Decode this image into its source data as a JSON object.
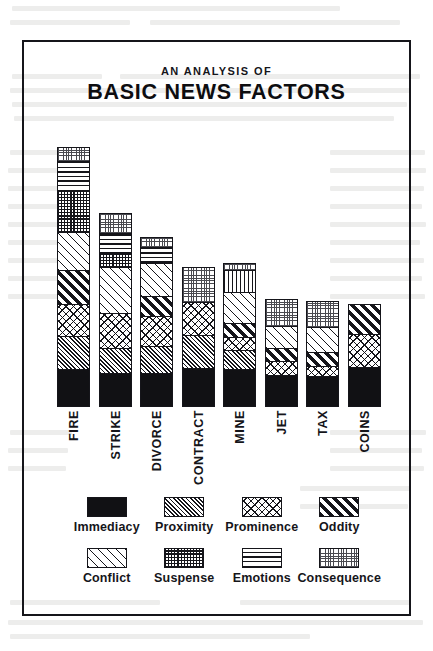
{
  "figure": {
    "title_sub": "AN ANALYSIS OF",
    "title_main": "BASIC NEWS FACTORS",
    "border_color": "#15151a",
    "ink_color": "#15151a",
    "paper_color": "#ffffff"
  },
  "chart_data": {
    "type": "bar",
    "subtype": "stacked-bar",
    "title": "AN ANALYSIS OF BASIC NEWS FACTORS",
    "subtitle": "AN ANALYSIS OF",
    "xlabel": "",
    "ylabel": "",
    "grid": false,
    "axis_ticks": false,
    "ylim": [
      0,
      260
    ],
    "legend_position": "bottom",
    "categories": [
      "FIRE",
      "STRIKE",
      "DIVORCE",
      "CONTRACT",
      "MINE",
      "JET",
      "TAX",
      "COINS"
    ],
    "totals": [
      260,
      194,
      170,
      140,
      144,
      108,
      106,
      103
    ],
    "series": [
      {
        "name": "Immediacy",
        "pattern": "solid-black",
        "values": [
          36,
          32,
          32,
          38,
          36,
          31,
          30,
          39
        ]
      },
      {
        "name": "Proximity",
        "pattern": "fine-diagonal",
        "values": [
          34,
          26,
          28,
          33,
          20,
          0,
          0,
          0
        ]
      },
      {
        "name": "Prominence",
        "pattern": "cross-hatch",
        "values": [
          32,
          35,
          30,
          33,
          13,
          14,
          10,
          33
        ]
      },
      {
        "name": "Oddity",
        "pattern": "bold-diagonal",
        "values": [
          34,
          0,
          20,
          0,
          14,
          13,
          14,
          31
        ]
      },
      {
        "name": "Conflict",
        "pattern": "sparse-diagonal",
        "values": [
          38,
          46,
          34,
          0,
          32,
          23,
          25,
          0
        ]
      },
      {
        "name": "Suspense",
        "pattern": "dark-grid",
        "values": [
          42,
          14,
          0,
          0,
          0,
          0,
          0,
          0
        ]
      },
      {
        "name": "Emotions",
        "pattern": "horizontal-lines",
        "values": [
          30,
          21,
          16,
          0,
          22,
          0,
          0,
          0
        ]
      },
      {
        "name": "Consequence",
        "pattern": "light-stipple",
        "values": [
          14,
          20,
          10,
          36,
          7,
          27,
          27,
          0
        ]
      }
    ],
    "stack_order_bottom_to_top": [
      "Immediacy",
      "Proximity",
      "Prominence",
      "Oddity",
      "Conflict",
      "Suspense",
      "Emotions",
      "Consequence"
    ],
    "bars": [
      {
        "category": "FIRE",
        "segments_top_to_bottom": [
          "Consequence",
          "Emotions",
          "Suspense",
          "Conflict",
          "Oddity",
          "Prominence",
          "Proximity",
          "Immediacy"
        ]
      },
      {
        "category": "STRIKE",
        "segments_top_to_bottom": [
          "Consequence",
          "Emotions",
          "Suspense",
          "Conflict",
          "Prominence",
          "Proximity",
          "Immediacy"
        ]
      },
      {
        "category": "DIVORCE",
        "segments_top_to_bottom": [
          "Consequence",
          "Emotions",
          "Conflict",
          "Oddity",
          "Prominence",
          "Proximity",
          "Immediacy"
        ]
      },
      {
        "category": "CONTRACT",
        "segments_top_to_bottom": [
          "Consequence",
          "Prominence",
          "Proximity",
          "Immediacy"
        ]
      },
      {
        "category": "MINE",
        "segments_top_to_bottom": [
          "Consequence",
          "Emotions",
          "Conflict",
          "Oddity",
          "Prominence",
          "Proximity",
          "Immediacy"
        ]
      },
      {
        "category": "JET",
        "segments_top_to_bottom": [
          "Consequence",
          "Conflict",
          "Oddity",
          "Prominence",
          "Immediacy"
        ]
      },
      {
        "category": "TAX",
        "segments_top_to_bottom": [
          "Consequence",
          "Conflict",
          "Oddity",
          "Prominence",
          "Immediacy"
        ]
      },
      {
        "category": "COINS",
        "segments_top_to_bottom": [
          "Oddity",
          "Prominence",
          "Immediacy"
        ]
      }
    ],
    "legend": [
      {
        "label": "Immediacy",
        "pattern": "solid-black"
      },
      {
        "label": "Proximity",
        "pattern": "fine-diagonal"
      },
      {
        "label": "Prominence",
        "pattern": "cross-hatch"
      },
      {
        "label": "Oddity",
        "pattern": "bold-diagonal"
      },
      {
        "label": "Conflict",
        "pattern": "sparse-diagonal"
      },
      {
        "label": "Suspense",
        "pattern": "dark-grid"
      },
      {
        "label": "Emotions",
        "pattern": "horizontal-lines"
      },
      {
        "label": "Consequence",
        "pattern": "light-stipple"
      }
    ]
  }
}
